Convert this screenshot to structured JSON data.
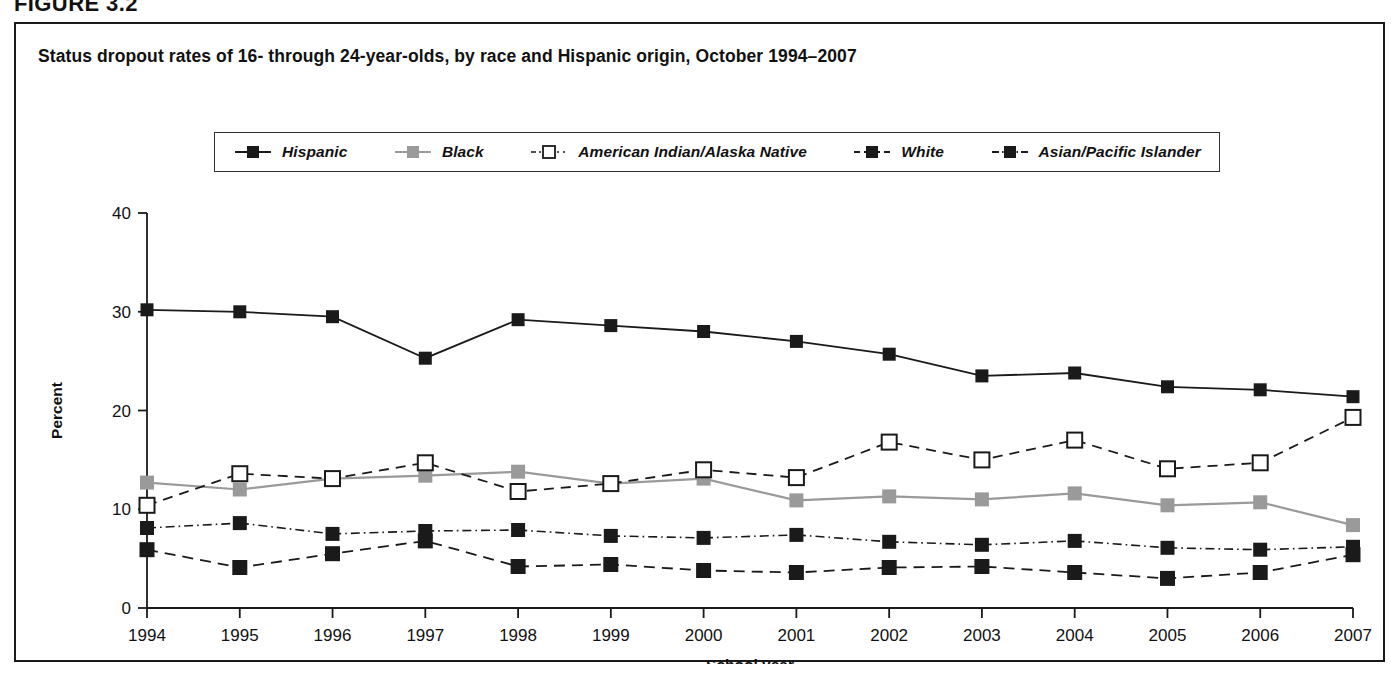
{
  "figure": {
    "label": "FIGURE 3.2"
  },
  "chart_title": "Status dropout rates of 16- through 24-year-olds, by race and Hispanic origin, October 1994–2007",
  "axis": {
    "ylabel": "Percent",
    "xlabel": "School year"
  },
  "legend": {
    "items": [
      {
        "label": "Hispanic",
        "style": "solid-filled-black"
      },
      {
        "label": "Black",
        "style": "solid-filled-gray"
      },
      {
        "label": "American Indian/Alaska Native",
        "style": "dashed-open-square"
      },
      {
        "label": "White",
        "style": "dashed-filled-black"
      },
      {
        "label": "Asian/Pacific Islander",
        "style": "dashdot-filled-black"
      }
    ]
  },
  "colors": {
    "hispanic": "#1a1a1a",
    "black": "#9a9a9a",
    "american_indian": "#1a1a1a",
    "white": "#1a1a1a",
    "asian_pacific_islander": "#1a1a1a",
    "frame": "#1a1a1a",
    "background": "#ffffff"
  },
  "chart_data": {
    "type": "line",
    "title": "Status dropout rates of 16- through 24-year-olds, by race and Hispanic origin, October 1994–2007",
    "xlabel": "School year",
    "ylabel": "Percent",
    "ylim": [
      0,
      40
    ],
    "yticks": [
      0,
      10,
      20,
      30,
      40
    ],
    "grid": false,
    "legend_position": "top-center",
    "x": [
      1994,
      1995,
      1996,
      1997,
      1998,
      1999,
      2000,
      2001,
      2002,
      2003,
      2004,
      2005,
      2006,
      2007
    ],
    "categories": [
      "1994",
      "1995",
      "1996",
      "1997",
      "1998",
      "1999",
      "2000",
      "2001",
      "2002",
      "2003",
      "2004",
      "2005",
      "2006",
      "2007"
    ],
    "series": [
      {
        "name": "Hispanic",
        "values": [
          30.2,
          30.0,
          29.5,
          25.3,
          29.2,
          28.6,
          28.0,
          27.0,
          25.7,
          23.5,
          23.8,
          22.4,
          22.1,
          21.4
        ]
      },
      {
        "name": "Black",
        "values": [
          12.7,
          12.0,
          13.1,
          13.4,
          13.8,
          12.6,
          13.1,
          10.9,
          11.3,
          11.0,
          11.6,
          10.4,
          10.7,
          8.4
        ]
      },
      {
        "name": "American Indian/Alaska Native",
        "values": [
          10.4,
          13.6,
          13.1,
          14.7,
          11.8,
          12.6,
          14.0,
          13.2,
          16.8,
          15.0,
          17.0,
          14.1,
          14.7,
          19.3
        ]
      },
      {
        "name": "White",
        "values": [
          5.9,
          4.1,
          5.5,
          6.8,
          4.2,
          4.4,
          3.8,
          3.6,
          4.1,
          4.2,
          3.6,
          3.0,
          3.6,
          5.4
        ]
      },
      {
        "name": "Asian/Pacific Islander",
        "values": [
          8.1,
          8.6,
          7.5,
          7.8,
          7.9,
          7.3,
          7.1,
          7.4,
          6.7,
          6.4,
          6.8,
          6.1,
          5.9,
          6.2
        ]
      }
    ]
  }
}
